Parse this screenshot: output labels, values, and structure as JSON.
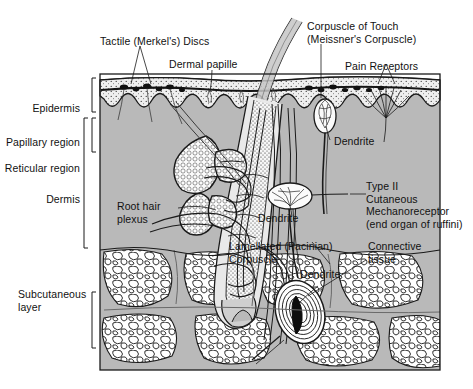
{
  "figure": {
    "type": "anatomical-diagram",
    "colors": {
      "dermis_fill": "#b9b9b9",
      "epidermis_fill": "#e8e8e8",
      "gland_fill": "#f4f4f4",
      "adipose_fill": "#ffffff",
      "stroke": "#1a1a1a",
      "background": "#ffffff",
      "label_text": "#111111"
    }
  },
  "labels": {
    "left": [
      {
        "id": "epidermis",
        "text": "Epidermis"
      },
      {
        "id": "papillary-region",
        "text": "Papillary region"
      },
      {
        "id": "reticular-region",
        "text": "Reticular region"
      },
      {
        "id": "dermis",
        "text": "Dermis"
      },
      {
        "id": "subcutaneous-layer",
        "text": "Subcutaneous\nlayer"
      }
    ],
    "top": [
      {
        "id": "tactile-merkels-discs",
        "text": "Tactile (Merkel's) Discs"
      },
      {
        "id": "dermal-papille",
        "text": "Dermal papille"
      },
      {
        "id": "corpuscle-of-touch",
        "text": "Corpuscle of Touch\n(Meissner's Corpuscle)"
      },
      {
        "id": "pain-receptors",
        "text": "Pain Receptors"
      }
    ],
    "interior": [
      {
        "id": "dendrite-meissner",
        "text": "Dendrite"
      },
      {
        "id": "root-hair-plexus",
        "text": "Root hair\nplexus"
      },
      {
        "id": "dendrite-ruffini",
        "text": "Dendrite"
      },
      {
        "id": "lamellated-pacinian-corpuscle",
        "text": "Lamellated (Pacinian)\nCorpuscle"
      },
      {
        "id": "dendrite-pacinian",
        "text": "Dendrite"
      }
    ],
    "right": [
      {
        "id": "type-ii-cutaneous-mechanoreceptor",
        "text": "Type II\nCutaneous\nMechanoreceptor\n(end organ of ruffini)"
      },
      {
        "id": "connective-tissue",
        "text": "Connective\ntissue"
      }
    ]
  },
  "structures": [
    "epidermis-layer",
    "dermal-papillae",
    "hair-shaft",
    "hair-follicle",
    "sebaceous-gland",
    "arrector-pili-muscle",
    "sweat-gland-duct",
    "root-hair-plexus",
    "meissner-corpuscle",
    "merkel-discs",
    "free-nerve-endings",
    "ruffini-ending",
    "pacinian-corpuscle",
    "adipose-tissue",
    "connective-tissue-septa"
  ]
}
